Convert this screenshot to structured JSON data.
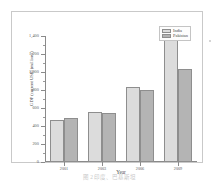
{
  "figure": {
    "caption": "图 2 印度、巴基斯坦"
  },
  "legend": {
    "position": "top-right",
    "entries": [
      {
        "label": "India",
        "color": "#dcdcdc"
      },
      {
        "label": "Pakistan",
        "color": "#b4b4b4"
      }
    ]
  },
  "axes": {
    "xlabel": "Year",
    "ylabel": "GDP (current US$) (millions)",
    "y_ticks": [
      "0",
      "200",
      "400",
      "600",
      "800",
      "1,000",
      "1,200",
      "1,400"
    ],
    "x_ticks": [
      "2001",
      "2003",
      "2006",
      "2009"
    ]
  },
  "chart_data": {
    "type": "bar",
    "title": "",
    "xlabel": "Year",
    "ylabel": "GDP (current US$) (millions)",
    "categories": [
      "2001",
      "2003",
      "2006",
      "2009"
    ],
    "series": [
      {
        "name": "India",
        "color": "#dcdcdc",
        "values": [
          470,
          560,
          830,
          1370
        ]
      },
      {
        "name": "Pakistan",
        "color": "#b4b4b4",
        "values": [
          490,
          545,
          800,
          1030
        ]
      }
    ],
    "ylim": [
      0,
      1400
    ],
    "ytick_step": 200,
    "grid": false,
    "legend_position": "top-right"
  }
}
